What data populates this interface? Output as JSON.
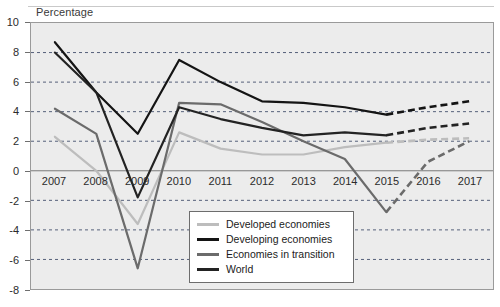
{
  "axis_title": "Percentage",
  "colors": {
    "plot_background": "#ececec",
    "frame": "#9a9a9a",
    "gridline": "#55607a",
    "zero_line": "#7a7a7a",
    "developed": "#bdbdbd",
    "developing": "#141414",
    "transition": "#6b6b6b",
    "world": "#232323",
    "legend_border": "#6d6d6d",
    "text": "#2b2b2b"
  },
  "legend": {
    "items": [
      {
        "label": "Developed economies",
        "color": "#bdbdbd",
        "width": 3.2
      },
      {
        "label": "Developing economies",
        "color": "#141414",
        "width": 3.2
      },
      {
        "label": "Economies in transition",
        "color": "#6b6b6b",
        "width": 3.2
      },
      {
        "label": "World",
        "color": "#232323",
        "width": 3.2
      }
    ]
  },
  "chart_data": {
    "type": "line",
    "title": "",
    "xlabel": "",
    "ylabel": "Percentage",
    "x": [
      2007,
      2008,
      2009,
      2010,
      2011,
      2012,
      2013,
      2014,
      2015,
      2016,
      2017
    ],
    "tick_labels": [
      "2007",
      "2008",
      "2009",
      "2010",
      "2011",
      "2012",
      "2013",
      "2014",
      "2015",
      "2016",
      "2017"
    ],
    "ylim": [
      -8,
      10
    ],
    "yticks": [
      -8,
      -6,
      -4,
      -2,
      0,
      2,
      4,
      6,
      8,
      10
    ],
    "grid": true,
    "gridlines_at": [
      -6,
      -4,
      -2,
      2,
      4,
      6,
      8
    ],
    "zero_line": 0,
    "legend_position": "bottom-center",
    "forecast_from": 2015,
    "forecast_style": "dashed",
    "series": [
      {
        "name": "Developed economies",
        "color": "#bdbdbd",
        "values": [
          2.3,
          0.0,
          -3.6,
          2.6,
          1.5,
          1.1,
          1.1,
          1.6,
          1.9,
          2.1,
          2.2
        ]
      },
      {
        "name": "Developing economies",
        "color": "#141414",
        "values": [
          8.7,
          5.3,
          2.5,
          7.5,
          6.0,
          4.7,
          4.6,
          4.3,
          3.8,
          4.3,
          4.7
        ]
      },
      {
        "name": "Economies in transition",
        "color": "#6b6b6b",
        "values": [
          4.2,
          2.5,
          -6.6,
          4.6,
          4.5,
          3.3,
          2.0,
          0.8,
          -2.8,
          0.6,
          2.0
        ]
      },
      {
        "name": "World",
        "color": "#232323",
        "values": [
          8.0,
          5.3,
          -1.8,
          4.3,
          3.5,
          2.9,
          2.4,
          2.6,
          2.4,
          2.9,
          3.2
        ]
      }
    ]
  }
}
